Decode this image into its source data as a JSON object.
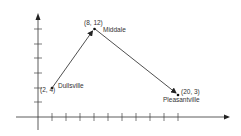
{
  "diagram": {
    "type": "route-on-coordinate-grid",
    "axes": {
      "x_ticks": 10,
      "y_ticks": 6,
      "color": "#222222"
    },
    "points": [
      {
        "id": "dullsville",
        "coord_label": "(2, 4)",
        "name": "Dullsville",
        "x": 2,
        "y": 4
      },
      {
        "id": "middale",
        "coord_label": "(8, 12)",
        "name": "Middale",
        "x": 8,
        "y": 12
      },
      {
        "id": "pleasantville",
        "coord_label": "(20, 3)",
        "name": "Pleasantville",
        "x": 20,
        "y": 3
      }
    ],
    "arrows": [
      {
        "from": "dullsville",
        "to": "middale"
      },
      {
        "from": "middale",
        "to": "pleasantville"
      }
    ]
  }
}
